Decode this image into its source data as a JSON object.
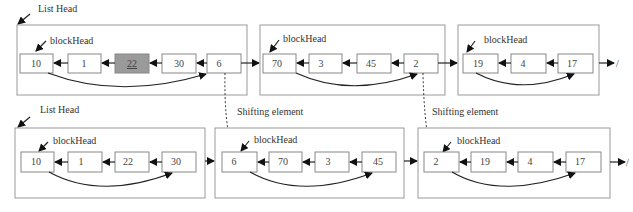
{
  "labels": {
    "list_head": "List Head",
    "block_head": "blockHead",
    "shifting_element": "Shifting element",
    "null_marker": "/"
  },
  "top_row": {
    "blocks": [
      {
        "nodes": [
          "10",
          "1",
          "22",
          "30",
          "6"
        ],
        "highlighted_index": 2
      },
      {
        "nodes": [
          "70",
          "3",
          "45",
          "2"
        ]
      },
      {
        "nodes": [
          "19",
          "4",
          "17"
        ]
      }
    ]
  },
  "bottom_row": {
    "blocks": [
      {
        "nodes": [
          "10",
          "1",
          "22",
          "30"
        ]
      },
      {
        "nodes": [
          "6",
          "70",
          "3",
          "45"
        ]
      },
      {
        "nodes": [
          "2",
          "19",
          "4",
          "17"
        ]
      }
    ]
  },
  "colors": {
    "highlight_fill": "#9a9a9a",
    "box_stroke": "#888888",
    "arrow": "#222222"
  }
}
